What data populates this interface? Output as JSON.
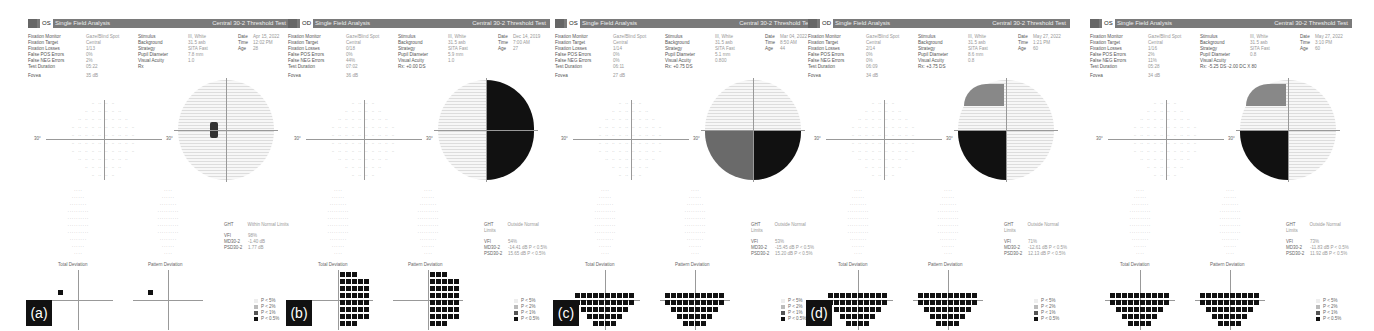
{
  "panels": [
    {
      "label": "(a)",
      "eye": "OS",
      "title": "Single Field Analysis",
      "test": "Central 30-2 Threshold Test",
      "fixation_monitor": "Gaze/Blind Spot",
      "fixation_target": "Central",
      "fixation_losses": "1/13",
      "false_pos": "0%",
      "false_neg": "2%",
      "test_duration": "05:22",
      "fovea": "35 dB",
      "stimulus": "III, White",
      "background": "31.5 asb",
      "strategy": "SITA Fast",
      "pupil_diameter": "7.8 mm",
      "visual_acuity": "1.0",
      "rx": "Rx",
      "date": "Apr 15, 2022",
      "time": "12:02 PM",
      "age": "28",
      "ght": "Within Normal Limits",
      "vfi": "98%",
      "md": "-1.40 dB",
      "psd": "1.77 dB",
      "defect": "none"
    },
    {
      "label": "(b)",
      "eye": "OD",
      "title": "Single Field Analysis",
      "test": "Central 30-2 Threshold Test",
      "fixation_monitor": "Gaze/Blind Spot",
      "fixation_target": "Central",
      "fixation_losses": "0/18",
      "false_pos": "0%",
      "false_neg": "44%",
      "test_duration": "07:02",
      "fovea": "36 dB",
      "stimulus": "III, White",
      "background": "31.5 asb",
      "strategy": "SITA Fast",
      "pupil_diameter": "5.9 mm",
      "visual_acuity": "1.0",
      "rx": "Rx: +0.00 DS",
      "date": "Dec 14, 2019",
      "time": "7:00 AM",
      "age": "27",
      "ght": "Outside Normal Limits",
      "vfi": "54%",
      "md": "-14.41 dB P < 0.5%",
      "psd": "15.65 dB P < 0.5%",
      "defect": "right-hemi"
    },
    {
      "label": "(c)",
      "eye": "OS",
      "title": "Single Field Analysis",
      "test": "Central 30-2 Threshold Test",
      "fixation_monitor": "Gaze/Blind Spot",
      "fixation_target": "Central",
      "fixation_losses": "1/14",
      "false_pos": "0%",
      "false_neg": "0%",
      "test_duration": "06:11",
      "fovea": "27 dB",
      "stimulus": "III, White",
      "background": "31.5 asb",
      "strategy": "SITA Fast",
      "pupil_diameter": "5.1 mm",
      "visual_acuity": "0.800",
      "rx": "Rx: +0.75 DS",
      "date": "Mar 04, 2022",
      "time": "8:50 AM",
      "age": "44",
      "ght": "Outside Normal Limits",
      "vfi": "53%",
      "md": "-15.45 dB P < 0.5%",
      "psd": "15.20 dB P < 0.5%",
      "defect": "inferior"
    },
    {
      "label": "(d)",
      "eye": "OD",
      "title": "Single Field Analysis",
      "test": "Central 30-2 Threshold Test",
      "fixation_monitor": "Gaze/Blind Spot",
      "fixation_target": "Central",
      "fixation_losses": "2/14",
      "false_pos": "0%",
      "false_neg": "0%",
      "test_duration": "06:09",
      "fovea": "34 dB",
      "stimulus": "III, White",
      "background": "31.5 asb",
      "strategy": "SITA Fast",
      "pupil_diameter": "8.6 mm",
      "visual_acuity": "0.8",
      "rx": "Rx: +3.75 DS",
      "date": "May 27, 2022",
      "time": "1:21 PM",
      "age": "60",
      "ght": "Outside Normal Limits",
      "vfi": "71%",
      "md": "-12.61 dB P < 0.5%",
      "psd": "12.13 dB P < 0.5%",
      "defect": "inferior-left"
    },
    {
      "label": "",
      "eye": "OS",
      "title": "Single Field Analysis",
      "test": "Central 30-2 Threshold Test",
      "fixation_monitor": "Gaze/Blind Spot",
      "fixation_target": "Central",
      "fixation_losses": "1/16",
      "false_pos": "2%",
      "false_neg": "11%",
      "test_duration": "05:28",
      "fovea": "34 dB",
      "stimulus": "III, White",
      "background": "31.5 asb",
      "strategy": "SITA Fast",
      "pupil_diameter": "",
      "visual_acuity": "0.8",
      "rx": "Rx: -5.25 DS -2.00 DC X 80",
      "date": "May 27, 2022",
      "time": "3:10 PM",
      "age": "60",
      "ght": "Outside Normal Limits",
      "vfi": "73%",
      "md": "-11.83 dB P < 0.5%",
      "psd": "11.92 dB P < 0.5%",
      "defect": "inferior-left"
    }
  ],
  "field_labels": {
    "fixation_monitor": "Fixation Monitor",
    "fixation_target": "Fixation Target",
    "fixation_losses": "Fixation Losses",
    "false_pos": "False POS Errors",
    "false_neg": "False NEG Errors",
    "test_duration": "Test Duration",
    "fovea": "Fovea",
    "stimulus": "Stimulus",
    "background": "Background",
    "strategy": "Strategy",
    "pupil_diameter": "Pupil Diameter",
    "visual_acuity": "Visual Acuity",
    "date": "Date",
    "time": "Time",
    "age": "Age",
    "ght": "GHT",
    "vfi": "VFI",
    "md": "MD30-2",
    "psd": "PSD30-2",
    "total_deviation": "Total Deviation",
    "pattern_deviation": "Pattern Deviation",
    "axis_30": "30°"
  },
  "legend": [
    "P < 5%",
    "P < 2%",
    "P < 1%",
    "P < 0.5%"
  ]
}
